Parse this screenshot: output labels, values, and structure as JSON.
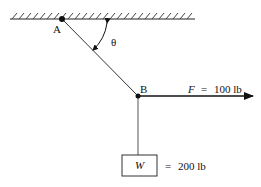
{
  "diagram": {
    "points": {
      "A": {
        "label": "A"
      },
      "B": {
        "label": "B"
      }
    },
    "angle": {
      "symbol": "θ"
    },
    "force": {
      "symbol": "F",
      "equals": "=",
      "value": "100 lb"
    },
    "weight": {
      "symbol": "W",
      "equals": "=",
      "value": "200 lb"
    },
    "colors": {
      "line": "#222222",
      "support": "#444444"
    }
  }
}
